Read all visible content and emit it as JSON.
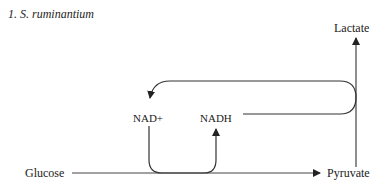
{
  "title": "1.  S. ruminantium",
  "nodes": {
    "lactate": "Lactate",
    "nad_plus": "NAD+",
    "nadh": "NADH",
    "glucose": "Glucose",
    "pyruvate": "Pyruvate"
  },
  "edges": [
    {
      "from": "Glucose",
      "to": "Pyruvate",
      "type": "arrow"
    },
    {
      "from": "Pyruvate",
      "to": "Lactate",
      "type": "arrow"
    },
    {
      "from": "NAD+",
      "to": "NADH",
      "type": "coupled-curve",
      "via": "Glucose→Pyruvate"
    },
    {
      "from": "NADH",
      "to": "NAD+",
      "type": "coupled-curve",
      "via": "Pyruvate→Lactate"
    }
  ],
  "colors": {
    "line": "#333333",
    "text": "#222222",
    "background": "#ffffff"
  }
}
